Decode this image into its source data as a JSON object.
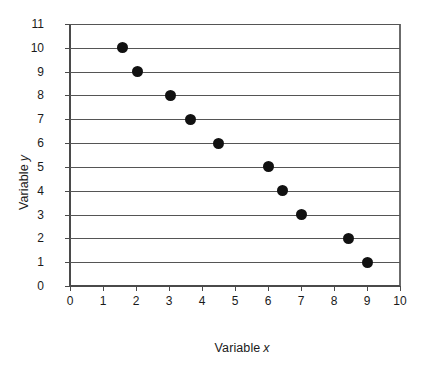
{
  "chart_data": {
    "type": "scatter",
    "title": "",
    "xlabel": "Variable x",
    "ylabel": "Variable y",
    "xlabel_prefix": "Variable",
    "xlabel_italic": "x",
    "ylabel_prefix": "Variable",
    "ylabel_italic": "y",
    "xlim": [
      0,
      10
    ],
    "ylim": [
      0,
      11
    ],
    "xticks": [
      0,
      1,
      2,
      3,
      4,
      5,
      6,
      7,
      8,
      9,
      10
    ],
    "yticks": [
      0,
      1,
      2,
      3,
      4,
      5,
      6,
      7,
      8,
      9,
      10,
      11
    ],
    "xtick_labels": [
      "0",
      "1",
      "2",
      "3",
      "4",
      "5",
      "6",
      "7",
      "8",
      "9",
      "10"
    ],
    "ytick_labels": [
      "0",
      "1",
      "2",
      "3",
      "4",
      "5",
      "6",
      "7",
      "8",
      "9",
      "10",
      "11"
    ],
    "grid": {
      "horizontal": true,
      "vertical": false,
      "color": "#555555"
    },
    "legend": null,
    "marker": {
      "shape": "circle",
      "color": "#111111",
      "size_px": 11
    },
    "series": [
      {
        "name": "data",
        "points": [
          {
            "x": 1.6,
            "y": 10
          },
          {
            "x": 2.05,
            "y": 9
          },
          {
            "x": 3.05,
            "y": 8
          },
          {
            "x": 3.65,
            "y": 7
          },
          {
            "x": 4.5,
            "y": 6
          },
          {
            "x": 6.0,
            "y": 5
          },
          {
            "x": 6.45,
            "y": 4
          },
          {
            "x": 7.0,
            "y": 3
          },
          {
            "x": 8.45,
            "y": 2
          },
          {
            "x": 9.0,
            "y": 1
          }
        ]
      }
    ]
  },
  "colors": {
    "background": "#ffffff",
    "axis": "#4a4a4a",
    "grid": "#555555",
    "marker": "#111111",
    "text": "#1a1a1a"
  }
}
